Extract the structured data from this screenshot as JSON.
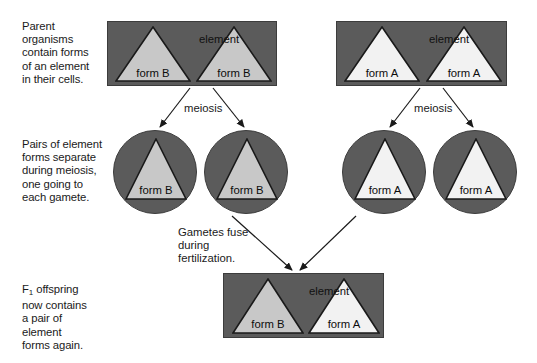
{
  "figure": {
    "background": "#ffffff",
    "cell_fill": "#5b5b5b",
    "cell_stroke": "#3c3c3c",
    "form_b_fill": "#c8c8c8",
    "form_a_fill": "#f2f2f2",
    "triangle_stroke": "#1a1a1a"
  },
  "captions": {
    "parent": "Parent\norganisms\ncontain forms\nof an element\nin their cells.",
    "pairs": "Pairs of element\nforms separate\nduring meiosis,\none going to\neach gamete.",
    "offspring_line1": "F",
    "offspring_sub": "1",
    "offspring_rest": " offspring",
    "offspring_tail": "now contains\na pair of\nelement\nforms again.",
    "fertilization": "Gametes fuse\nduring\nfertilization."
  },
  "row_parents": {
    "left_cell": {
      "element_label": "element",
      "triangles": [
        {
          "label": "form B",
          "variant": "B"
        },
        {
          "label": "form B",
          "variant": "B"
        }
      ]
    },
    "right_cell": {
      "element_label": "element",
      "triangles": [
        {
          "label": "form A",
          "variant": "A"
        },
        {
          "label": "form A",
          "variant": "A"
        }
      ]
    },
    "meiosis_label_left": "meiosis",
    "meiosis_label_right": "meiosis"
  },
  "row_gametes": {
    "gametes": [
      {
        "label": "form B",
        "variant": "B"
      },
      {
        "label": "form B",
        "variant": "B"
      },
      {
        "label": "form A",
        "variant": "A"
      },
      {
        "label": "form A",
        "variant": "A"
      }
    ]
  },
  "row_offspring": {
    "cell": {
      "element_label": "element",
      "triangles": [
        {
          "label": "form B",
          "variant": "B"
        },
        {
          "label": "form A",
          "variant": "A"
        }
      ]
    }
  }
}
